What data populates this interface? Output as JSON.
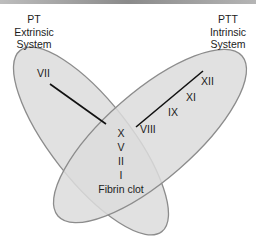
{
  "diagram": {
    "left_system": {
      "title": "PT",
      "line1": "Extrinsic",
      "line2": "System",
      "factors": [
        "VII"
      ]
    },
    "right_system": {
      "title": "PTT",
      "line1": "Intrinsic",
      "line2": "System",
      "factors": [
        "XII",
        "XI",
        "IX",
        "VIII"
      ]
    },
    "common_pathway": {
      "factors": [
        "X",
        "V",
        "II",
        "I"
      ],
      "result": "Fibrin clot"
    },
    "colors": {
      "ellipse_fill": "#dcdcdc",
      "ellipse_stroke": "#8c8c8c",
      "line": "#111111"
    }
  }
}
